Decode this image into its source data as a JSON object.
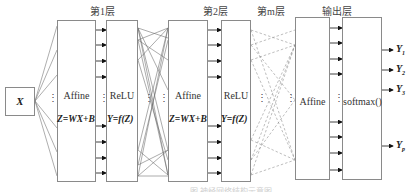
{
  "diagram": {
    "input": {
      "label": "X"
    },
    "layers": [
      {
        "header": "第1层",
        "affine_label": "Affine",
        "affine_eq": "Z=WX+B",
        "activation_label": "ReLU",
        "activation_eq": "Y=f(Z)"
      },
      {
        "header": "第2层",
        "affine_label": "Affine",
        "affine_eq": "Z=WX+B",
        "activation_label": "ReLU",
        "activation_eq": "Y=f(Z)"
      },
      {
        "header": "第m层",
        "connections": "dashed"
      }
    ],
    "output_layer": {
      "header": "输出层",
      "affine_label": "Affine",
      "activation_label": "softmax()"
    },
    "outputs": [
      {
        "name": "Y",
        "sub": "1"
      },
      {
        "name": "Y",
        "sub": "2"
      },
      {
        "name": "Y",
        "sub": "3"
      },
      {
        "name": "Y",
        "sub": "p"
      }
    ],
    "ellipsis": "⋮",
    "caption": "图  神经网络结构示意图"
  },
  "colors": {
    "line": "#6a6a6a",
    "box_border": "#8a8a8a",
    "arrow": "#111111"
  }
}
